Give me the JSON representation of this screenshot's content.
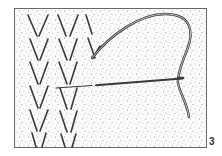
{
  "figure": {
    "label": "3",
    "colors": {
      "background": "#ffffff",
      "fabric_fill": "#fbfbfb",
      "speckle": "#8a8a8a",
      "stroke": "#3a3a3a",
      "frame": "#6a6a6a"
    }
  }
}
